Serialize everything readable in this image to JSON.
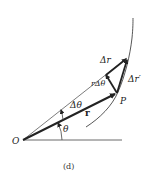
{
  "figure": {
    "caption": "(d)",
    "labels": {
      "origin": "O",
      "point": "P",
      "r_vector": "r",
      "theta": "θ",
      "delta_theta": "Δθ",
      "delta_r": "Δr",
      "delta_r_prime": "Δr′",
      "r_delta_theta": "rΔθ"
    },
    "colors": {
      "ink": "#222222",
      "background": "#ffffff"
    }
  }
}
